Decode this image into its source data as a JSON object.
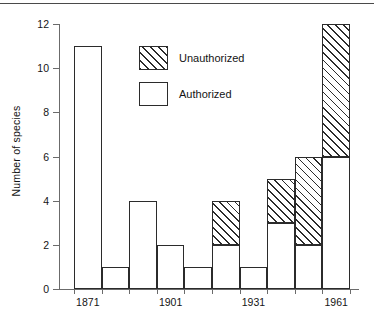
{
  "chart_data": {
    "type": "bar",
    "stacked": true,
    "title": "",
    "subtitle": "",
    "xlabel": "",
    "ylabel": "Number of species",
    "ylim": [
      0,
      12
    ],
    "y_ticks": [
      0,
      2,
      4,
      6,
      8,
      10,
      12
    ],
    "y_tick_labels": [
      "0",
      "2",
      "4",
      "6",
      "8",
      "10",
      "12"
    ],
    "grid": false,
    "x_tick_labels": [
      "1871",
      "1901",
      "1931",
      "1961"
    ],
    "x_tick_bar_index": [
      0,
      3,
      6,
      9
    ],
    "categories": [
      "1871",
      "1881",
      "1891",
      "1901",
      "1911",
      "1921",
      "1931",
      "1941",
      "1951",
      "1961"
    ],
    "series": [
      {
        "name": "Authorized",
        "pattern": "solid-white",
        "values": [
          11,
          1,
          4,
          2,
          1,
          2,
          1,
          3,
          2,
          6
        ]
      },
      {
        "name": "Unauthorized",
        "pattern": "diagonal-hatch",
        "values": [
          0,
          0,
          0,
          0,
          0,
          2,
          0,
          2,
          4,
          6
        ]
      }
    ],
    "totals": [
      11,
      1,
      4,
      2,
      1,
      4,
      1,
      5,
      6,
      12
    ],
    "legend_position": "upper-center-left",
    "bar_gap": 0,
    "colors": {
      "outline": "#2b2b2b",
      "axis": "#6b6b6b",
      "authorized_fill": "#ffffff",
      "unauthorized_fill": "#ffffff",
      "unauthorized_hatch": "#2b2b2b",
      "text": "#141414",
      "background": "#ffffff"
    }
  },
  "legend": {
    "items": [
      {
        "label": "Unauthorized",
        "swatch": "unauthorized"
      },
      {
        "label": "Authorized",
        "swatch": "authorized"
      }
    ]
  },
  "axes": {
    "y_title": "Number of species"
  }
}
